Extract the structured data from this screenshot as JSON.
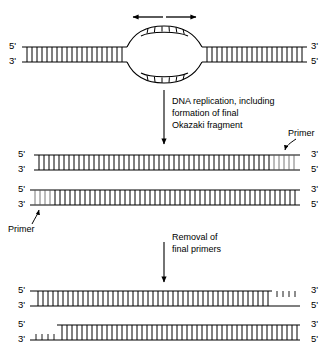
{
  "figure": {
    "ink_color": "#000000",
    "background_color": "#ffffff"
  },
  "labels": {
    "five_prime": "5'",
    "three_prime": "3'",
    "primer": "Primer",
    "step1_text_line1": "DNA replication, including",
    "step1_text_line2": "formation of final",
    "step1_text_line3": "Okazaki fragment",
    "step2_text_line1": "Removal of",
    "step2_text_line2": "final primers"
  },
  "stages": [
    {
      "id": "stage-1-replication-bubble",
      "name": "parental duplex with replication bubble",
      "left_labels": [
        "5'",
        "3'"
      ],
      "right_labels": [
        "3'",
        "5'"
      ],
      "arrows": "bidirectional fork movement"
    },
    {
      "id": "stage-2-replicated-duplexes",
      "name": "two daughter duplexes with terminal primers",
      "molecules": [
        {
          "id": "stage-2-top-duplex",
          "left_labels": [
            "5'",
            "3'"
          ],
          "right_labels": [
            "3'",
            "5'"
          ],
          "primer_location": "right end",
          "primer_label": "Primer"
        },
        {
          "id": "stage-2-bottom-duplex",
          "left_labels": [
            "5'",
            "3'"
          ],
          "right_labels": [
            "3'",
            "5'"
          ],
          "primer_location": "left end",
          "primer_label": "Primer"
        }
      ]
    },
    {
      "id": "stage-3-primers-removed",
      "name": "daughter duplexes with terminal gaps after primer removal",
      "molecules": [
        {
          "id": "stage-3-top-duplex",
          "left_labels": [
            "5'",
            "3'"
          ],
          "right_labels": [
            "3'",
            "5'"
          ],
          "gap_location": "right end"
        },
        {
          "id": "stage-3-bottom-duplex",
          "left_labels": [
            "5'",
            "3'"
          ],
          "right_labels": [
            "3'",
            "5'"
          ],
          "gap_location": "left end"
        }
      ]
    }
  ],
  "steps": [
    {
      "id": "step-arrow-1",
      "lines": [
        "DNA replication, including",
        "formation of final",
        "Okazaki fragment"
      ]
    },
    {
      "id": "step-arrow-2",
      "lines": [
        "Removal of",
        "final primers"
      ]
    }
  ]
}
